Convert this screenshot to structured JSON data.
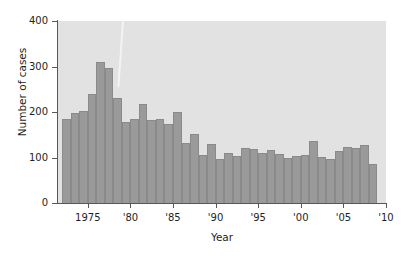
{
  "chart_data": {
    "type": "bar",
    "title": "",
    "xlabel": "Year",
    "ylabel": "Number of cases",
    "xlim": [
      1971.5,
      2010
    ],
    "ylim": [
      0,
      400
    ],
    "grid": false,
    "legend": null,
    "ytick_labels": [
      "0",
      "100",
      "200",
      "300",
      "400"
    ],
    "yticks": [
      0,
      100,
      200,
      300,
      400
    ],
    "xtick_labels": [
      "1975",
      "'80",
      "'85",
      "'90",
      "'95",
      "'00",
      "'05",
      "'10"
    ],
    "xticks": [
      1975,
      1980,
      1985,
      1990,
      1995,
      2000,
      2005,
      2010
    ],
    "bar_color": "#9a9a9a",
    "plot_background": "#e2e2e2",
    "categories": [
      1972,
      1973,
      1974,
      1975,
      1976,
      1977,
      1978,
      1979,
      1980,
      1981,
      1982,
      1983,
      1984,
      1985,
      1986,
      1987,
      1988,
      1989,
      1990,
      1991,
      1992,
      1993,
      1994,
      1995,
      1996,
      1997,
      1998,
      1999,
      2000,
      2001,
      2002,
      2003,
      2004,
      2005,
      2006,
      2007,
      2008
    ],
    "values": [
      185,
      198,
      203,
      240,
      310,
      297,
      230,
      178,
      185,
      218,
      183,
      184,
      173,
      200,
      131,
      152,
      106,
      130,
      97,
      110,
      103,
      120,
      119,
      110,
      117,
      107,
      100,
      103,
      105,
      137,
      102,
      96,
      115,
      123,
      122,
      128,
      85
    ]
  }
}
